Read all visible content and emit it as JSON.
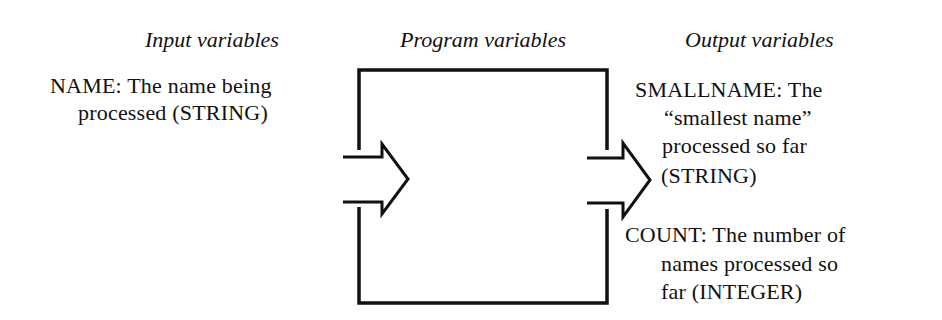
{
  "headings": {
    "input": "Input variables",
    "program": "Program variables",
    "output": "Output variables"
  },
  "input_variables": [
    {
      "lines": [
        "NAME: The name being",
        "processed (STRING)"
      ]
    }
  ],
  "output_variables": [
    {
      "lines": [
        "SMALLNAME: The",
        "“smallest name”",
        "processed so far",
        "(STRING)"
      ]
    },
    {
      "lines": [
        "COUNT: The number of",
        "names processed so",
        "far (INTEGER)"
      ]
    }
  ],
  "diagram": {
    "box": "program-box",
    "arrows": [
      "input-arrow",
      "output-arrow"
    ],
    "stroke_color": "#111111"
  }
}
